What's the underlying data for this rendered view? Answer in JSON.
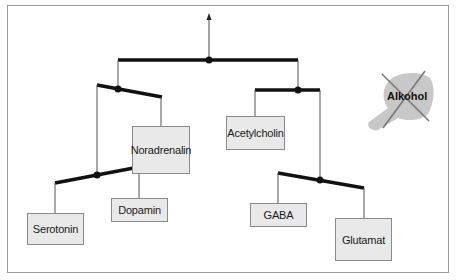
{
  "diagram": {
    "type": "mobile-balance-tree",
    "nodes": [
      {
        "id": "noradrenalin",
        "label": "Noradrenalin"
      },
      {
        "id": "acetylcholin",
        "label": "Acetylcholin"
      },
      {
        "id": "serotonin",
        "label": "Serotonin"
      },
      {
        "id": "dopamin",
        "label": "Dopamin"
      },
      {
        "id": "gaba",
        "label": "GABA"
      },
      {
        "id": "glutamat",
        "label": "Glutamat"
      }
    ],
    "icon": {
      "name": "alcohol-bottle-crossed-out-icon",
      "label": "Alkohol"
    },
    "colors": {
      "beam": "#111111",
      "line": "#555555",
      "box_fill": "#e9e9e9",
      "bottle": "#c8c8c8",
      "cross": "#777777"
    }
  }
}
